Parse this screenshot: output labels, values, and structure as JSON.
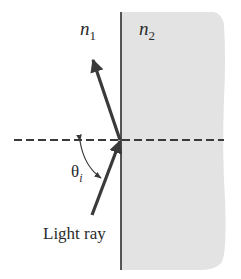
{
  "diagram": {
    "type": "optics-reflection",
    "labels": {
      "medium_left": "n",
      "medium_left_sub": "1",
      "medium_right": "n",
      "medium_right_sub": "2",
      "angle": "θ",
      "angle_sub": "i",
      "ray": "Light ray"
    },
    "colors": {
      "background": "#ffffff",
      "medium_right_fill": "#e3e3e3",
      "line": "#3a3a3a",
      "text": "#2b2b2b"
    }
  }
}
